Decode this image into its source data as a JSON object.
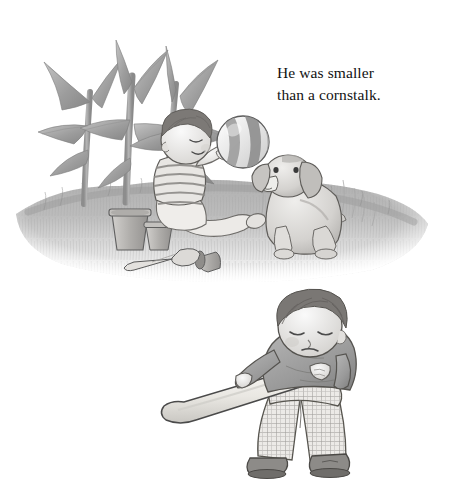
{
  "page": {
    "background_color": "#ffffff",
    "width": 450,
    "height": 488,
    "medium": "graphite pencil and grayscale watercolor picture-book illustration"
  },
  "caption": {
    "text": "He was smaller\nthan a cornstalk.",
    "line_1": "He was smaller",
    "line_2": "than a cornstalk.",
    "color": "#121212",
    "font_size_px": 15.5,
    "align": "left"
  },
  "illustrations": [
    {
      "id": "top-scene",
      "name": "baby-with-ball-and-puppy-in-garden",
      "description": "A baby sits on a grassy mound beside tall cornstalks, holding a striped ball out toward a seated puppy. Flower pots and a garden trowel lie on the grass.",
      "elements": [
        {
          "name": "cornstalks",
          "count": 3,
          "color": "#9a9a9a",
          "detail": "tall drooping blade leaves"
        },
        {
          "name": "baby",
          "hair_color": "#6d6a67",
          "shirt": "horizontal striped tee",
          "shirt_color": "#d8d8d8",
          "diaper_color": "#e8e6e2",
          "expression": "eyes closed, smiling"
        },
        {
          "name": "striped-ball",
          "color_light": "#ededed",
          "color_dark": "#8e8e8e",
          "stripes": 4
        },
        {
          "name": "puppy",
          "color": "#d6d4d2",
          "pose": "sitting",
          "ears": "floppy"
        },
        {
          "name": "flower-pot-large",
          "color": "#bdbbb8"
        },
        {
          "name": "flower-pot-small",
          "color": "#b5b3b0"
        },
        {
          "name": "tipped-pot",
          "color": "#a9a7a4"
        },
        {
          "name": "garden-trowel",
          "color": "#cfcdca"
        },
        {
          "name": "grass-mound",
          "color": "#b9b9b9"
        }
      ]
    },
    {
      "id": "bottom-scene",
      "name": "boy-with-baseball-bat",
      "description": "A boy in a dark sweater and checkered pants stands looking down, holding a baseball bat angled across his body.",
      "elements": [
        {
          "name": "boy",
          "hair_color": "#6a6764",
          "expression": "downcast, looking at the bat"
        },
        {
          "name": "sweater",
          "color": "#9b9b9b"
        },
        {
          "name": "checkered-pants",
          "color": "#e6e4e1",
          "grid_color": "#9c9a97"
        },
        {
          "name": "baseball-bat",
          "color": "#ebe9e4",
          "outline": "#4a4a4a"
        },
        {
          "name": "shoes",
          "count": 2,
          "color": "#7e7c79"
        }
      ]
    }
  ]
}
